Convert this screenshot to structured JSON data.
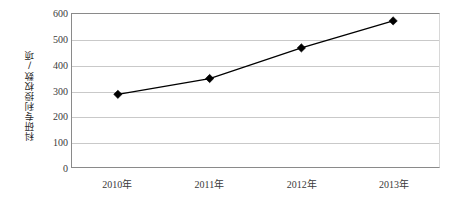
{
  "chart_data": {
    "type": "line",
    "title": "",
    "xlabel": "",
    "ylabel": "科研专利授权数/项",
    "categories": [
      "2010年",
      "2011年",
      "2012年",
      "2013年"
    ],
    "values": [
      285,
      347,
      467,
      573
    ],
    "series": [
      {
        "name": "科研专利授权数",
        "values": [
          285,
          347,
          467,
          573
        ]
      }
    ],
    "ylim": [
      0,
      600
    ],
    "y_ticks": [
      0,
      100,
      200,
      300,
      400,
      500,
      600
    ],
    "y_tick_labels": [
      "0",
      "100",
      "200",
      "300",
      "400",
      "500",
      "600"
    ],
    "grid": "horizontal",
    "legend": "none",
    "marker": "diamond",
    "line_color": "#000000",
    "marker_color": "#000000",
    "grid_color": "#c9c9c9",
    "axis_color": "#8a8a8a",
    "background_color": "#ffffff"
  },
  "axes": {
    "y_title": "科研专利授权数/项"
  }
}
